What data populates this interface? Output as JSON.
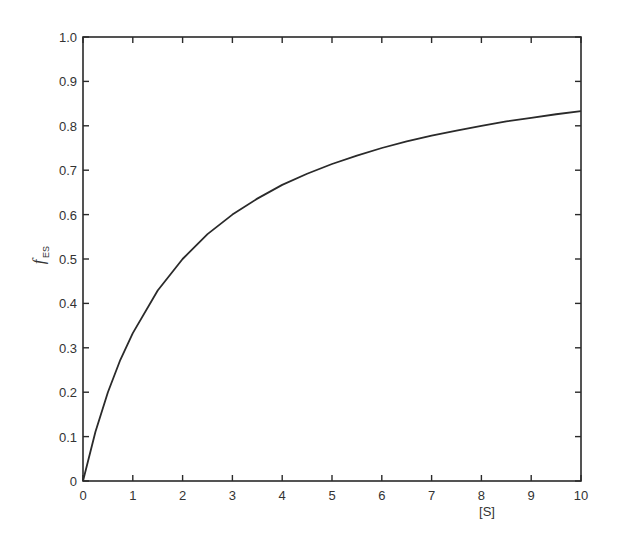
{
  "chart_data": {
    "type": "line",
    "title": "",
    "xlabel": "[S]",
    "ylabel": "f_ES",
    "ylabel_main": "f",
    "ylabel_sub": "ES",
    "xlim": [
      0,
      10
    ],
    "ylim": [
      0,
      1.0
    ],
    "grid": false,
    "legend": null,
    "x_ticks": [
      0,
      1,
      2,
      3,
      4,
      5,
      6,
      7,
      8,
      9,
      10
    ],
    "x_tick_labels": [
      "0",
      "1",
      "2",
      "3",
      "4",
      "5",
      "6",
      "7",
      "8",
      "9",
      "10"
    ],
    "y_ticks": [
      0,
      0.1,
      0.2,
      0.3,
      0.4,
      0.5,
      0.6,
      0.7,
      0.8,
      0.9,
      1.0
    ],
    "y_tick_labels": [
      "0",
      "0.1",
      "0.2",
      "0.3",
      "0.4",
      "0.5",
      "0.6",
      "0.7",
      "0.8",
      "0.9",
      "1.0"
    ],
    "series": [
      {
        "name": "f_ES",
        "color": "#2a2a2a",
        "x": [
          0,
          0.25,
          0.5,
          0.75,
          1,
          1.5,
          2,
          2.5,
          3,
          3.5,
          4,
          4.5,
          5,
          5.5,
          6,
          6.5,
          7,
          7.5,
          8,
          8.5,
          9,
          9.5,
          10
        ],
        "values": [
          0,
          0.111,
          0.2,
          0.273,
          0.333,
          0.429,
          0.5,
          0.556,
          0.6,
          0.636,
          0.667,
          0.692,
          0.714,
          0.733,
          0.75,
          0.765,
          0.778,
          0.789,
          0.8,
          0.81,
          0.818,
          0.826,
          0.833
        ]
      }
    ]
  }
}
